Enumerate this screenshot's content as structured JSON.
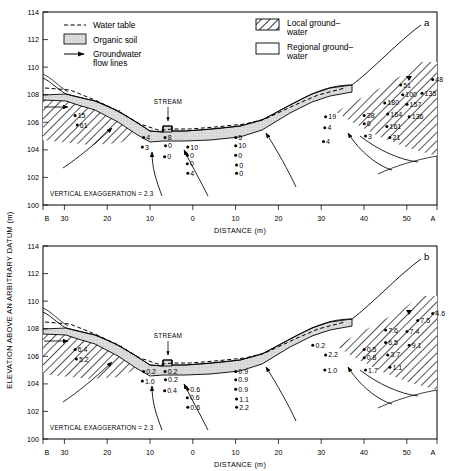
{
  "figure": {
    "y_axis_label": "ELEVATION ABOVE AN ARBITRARY DATUM (m)",
    "x_axis_label": "DISTANCE (m)",
    "vertical_exaggeration": "VERTICAL EXAGGERATION = 2.3",
    "stream_label": "STREAM",
    "y_ticks": [
      "100",
      "102",
      "104",
      "106",
      "108",
      "110",
      "112",
      "114"
    ],
    "x_ticks": [
      "B",
      "30",
      "20",
      "10",
      "0",
      "10",
      "20",
      "30",
      "40",
      "50",
      "A"
    ],
    "colors": {
      "line": "#000000",
      "organic_soil_fill": "#d9d9d9",
      "hatch": "#000000",
      "background": "#ffffff"
    }
  },
  "legend": {
    "items": [
      {
        "key": "water-table",
        "label": "Water table",
        "swatch": "dashed-line"
      },
      {
        "key": "organic-soil",
        "label": "Organic soil",
        "swatch": "stippled-box"
      },
      {
        "key": "groundwater-flow",
        "label": "Groundwater\nflow lines",
        "label_line1": "Groundwater",
        "label_line2": "flow lines",
        "swatch": "arrow"
      },
      {
        "key": "local-groundwater",
        "label_line1": "Local ground–",
        "label_line2": "water",
        "swatch": "hatched-box"
      },
      {
        "key": "regional-groundwater",
        "label_line1": "Regional ground–",
        "label_line2": "water",
        "swatch": "empty-box"
      }
    ]
  },
  "chart_data": {
    "type": "scatter",
    "xlabel": "DISTANCE (m)",
    "ylabel": "ELEVATION ABOVE AN ARBITRARY DATUM (m)",
    "xlim": [
      -35,
      57
    ],
    "ylim": [
      100,
      114
    ],
    "grid": false,
    "panels": [
      {
        "id": "a",
        "label": "a",
        "ylim": [
          100,
          114
        ],
        "note": "VERTICAL EXAGGERATION = 2.3",
        "points": [
          {
            "x": -27.5,
            "y": 106.5,
            "value": "15"
          },
          {
            "x": -27.0,
            "y": 105.8,
            "value": "61"
          },
          {
            "x": -11.5,
            "y": 104.9,
            "value": "4"
          },
          {
            "x": -11.8,
            "y": 104.2,
            "value": "3"
          },
          {
            "x": -6.5,
            "y": 104.9,
            "value": "8"
          },
          {
            "x": -6.4,
            "y": 104.3,
            "value": "0"
          },
          {
            "x": -6.6,
            "y": 103.5,
            "value": "0"
          },
          {
            "x": -1.2,
            "y": 104.2,
            "value": "10"
          },
          {
            "x": -1.3,
            "y": 103.6,
            "value": "0"
          },
          {
            "x": -1.3,
            "y": 103.0,
            "value": "0"
          },
          {
            "x": -1.2,
            "y": 102.3,
            "value": "4"
          },
          {
            "x": 10.0,
            "y": 104.9,
            "value": "5"
          },
          {
            "x": 10.0,
            "y": 104.3,
            "value": "10"
          },
          {
            "x": 10.0,
            "y": 103.6,
            "value": "0"
          },
          {
            "x": 10.2,
            "y": 102.9,
            "value": "0"
          },
          {
            "x": 10.2,
            "y": 102.3,
            "value": "0"
          },
          {
            "x": 31.0,
            "y": 106.4,
            "value": "19"
          },
          {
            "x": 30.8,
            "y": 105.6,
            "value": "4"
          },
          {
            "x": 30.5,
            "y": 104.6,
            "value": "4"
          },
          {
            "x": 40.0,
            "y": 106.5,
            "value": "38"
          },
          {
            "x": 40.0,
            "y": 105.9,
            "value": "6"
          },
          {
            "x": 40.3,
            "y": 105.0,
            "value": "3"
          },
          {
            "x": 56.0,
            "y": 109.1,
            "value": "48"
          },
          {
            "x": 48.5,
            "y": 108.7,
            "value": "51"
          },
          {
            "x": 49.0,
            "y": 108.0,
            "value": "100"
          },
          {
            "x": 53.5,
            "y": 108.1,
            "value": "135"
          },
          {
            "x": 44.8,
            "y": 107.4,
            "value": "180"
          },
          {
            "x": 50.0,
            "y": 107.3,
            "value": "157"
          },
          {
            "x": 45.5,
            "y": 106.6,
            "value": "164"
          },
          {
            "x": 50.5,
            "y": 106.4,
            "value": "136"
          },
          {
            "x": 45.3,
            "y": 105.7,
            "value": "161"
          },
          {
            "x": 46.0,
            "y": 104.9,
            "value": "21"
          }
        ]
      },
      {
        "id": "b",
        "label": "b",
        "ylim": [
          100,
          114
        ],
        "note": "VERTICAL EXAGGERATION = 2.3",
        "points": [
          {
            "x": -27.5,
            "y": 106.5,
            "value": "6.4"
          },
          {
            "x": -27.2,
            "y": 105.8,
            "value": "5.2"
          },
          {
            "x": -11.5,
            "y": 104.9,
            "value": "0.2"
          },
          {
            "x": -11.8,
            "y": 104.2,
            "value": "1.0"
          },
          {
            "x": -6.5,
            "y": 104.9,
            "value": "0.2"
          },
          {
            "x": -6.4,
            "y": 104.3,
            "value": "0.2"
          },
          {
            "x": -6.6,
            "y": 103.5,
            "value": "0.4"
          },
          {
            "x": -1.2,
            "y": 103.6,
            "value": "0.6"
          },
          {
            "x": -1.3,
            "y": 103.0,
            "value": "0.6"
          },
          {
            "x": -1.2,
            "y": 102.3,
            "value": "0.6"
          },
          {
            "x": 10.0,
            "y": 104.9,
            "value": "0.9"
          },
          {
            "x": 10.0,
            "y": 104.3,
            "value": "0.9"
          },
          {
            "x": 10.0,
            "y": 103.6,
            "value": "0.9"
          },
          {
            "x": 10.2,
            "y": 102.9,
            "value": "1.1"
          },
          {
            "x": 10.2,
            "y": 102.3,
            "value": "2.2"
          },
          {
            "x": 31.0,
            "y": 106.1,
            "value": "2.2"
          },
          {
            "x": 30.8,
            "y": 105.0,
            "value": "1.0"
          },
          {
            "x": 28.0,
            "y": 106.8,
            "value": "0.2"
          },
          {
            "x": 40.0,
            "y": 106.5,
            "value": "0.5"
          },
          {
            "x": 40.0,
            "y": 105.9,
            "value": "0.8"
          },
          {
            "x": 40.3,
            "y": 105.0,
            "value": "1.7"
          },
          {
            "x": 56.0,
            "y": 109.1,
            "value": "4.6"
          },
          {
            "x": 52.5,
            "y": 108.6,
            "value": "7.5"
          },
          {
            "x": 45.0,
            "y": 107.9,
            "value": "7.6"
          },
          {
            "x": 50.0,
            "y": 107.8,
            "value": "7.4"
          },
          {
            "x": 45.0,
            "y": 107.0,
            "value": "6.5"
          },
          {
            "x": 50.5,
            "y": 106.8,
            "value": "9.1"
          },
          {
            "x": 45.5,
            "y": 106.1,
            "value": "3.7"
          },
          {
            "x": 46.0,
            "y": 105.2,
            "value": "1.1"
          }
        ]
      }
    ]
  },
  "panels": {
    "a": {
      "label": "a"
    },
    "b": {
      "label": "b"
    }
  }
}
